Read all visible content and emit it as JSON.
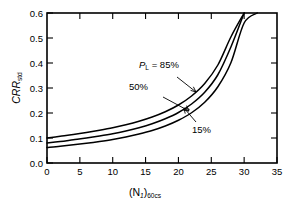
{
  "figure": {
    "background_color": "#ffffff",
    "line_color": "#000000"
  },
  "chart_data": {
    "type": "line",
    "title": "",
    "subtitle": "",
    "xlabel_main": "(N",
    "xlabel_sub1": "1",
    "xlabel_mid": ")",
    "xlabel_sub2": "60cs",
    "xlabel_plain": "(N1)60cs",
    "ylabel_main": "CRR",
    "ylabel_sub": "std",
    "ylabel_plain": "CRRstd",
    "xlim": [
      0,
      35
    ],
    "ylim": [
      0.0,
      0.6
    ],
    "xticks": [
      0,
      5,
      10,
      15,
      20,
      25,
      30,
      35
    ],
    "yticks": [
      0.0,
      0.1,
      0.2,
      0.3,
      0.4,
      0.5,
      0.6
    ],
    "xticklabels": [
      "0",
      "5",
      "10",
      "15",
      "20",
      "25",
      "30",
      "35"
    ],
    "yticklabels": [
      "0.0",
      "0.1",
      "0.2",
      "0.3",
      "0.4",
      "0.5",
      "0.6"
    ],
    "grid": false,
    "legend_position": "inline-annotations",
    "tick_direction": "in",
    "frame": "box",
    "x": [
      0,
      2,
      4,
      6,
      8,
      10,
      12,
      14,
      16,
      18,
      20,
      22,
      24,
      26,
      28,
      30,
      32
    ],
    "series": [
      {
        "name": "PL = 85%",
        "label": "P",
        "label_sub": "L",
        "label_rest": " = 85%",
        "label_plain": "PL = 85%",
        "values": [
          0.1,
          0.107,
          0.114,
          0.122,
          0.131,
          0.141,
          0.153,
          0.167,
          0.184,
          0.205,
          0.232,
          0.268,
          0.318,
          0.392,
          0.505,
          0.6,
          null
        ],
        "annotation_xy": [
          23.5,
          0.305
        ],
        "label_xy": [
          15.5,
          0.425
        ]
      },
      {
        "name": "PL = 50%",
        "label": "50%",
        "label_plain": "50%",
        "values": [
          0.08,
          0.086,
          0.093,
          0.1,
          0.108,
          0.117,
          0.128,
          0.141,
          0.157,
          0.177,
          0.202,
          0.236,
          0.283,
          0.353,
          0.465,
          0.6,
          null
        ],
        "annotation_xy": [
          24.8,
          0.222
        ],
        "label_xy": [
          13.5,
          0.318
        ]
      },
      {
        "name": "PL = 15%",
        "label": "15%",
        "label_plain": "15%",
        "values": [
          0.062,
          0.067,
          0.073,
          0.079,
          0.086,
          0.094,
          0.104,
          0.116,
          0.13,
          0.148,
          0.171,
          0.201,
          0.243,
          0.305,
          0.402,
          0.56,
          0.6
        ],
        "annotation_xy": [
          23.0,
          0.173
        ],
        "label_xy": [
          26.5,
          0.122
        ]
      }
    ]
  }
}
